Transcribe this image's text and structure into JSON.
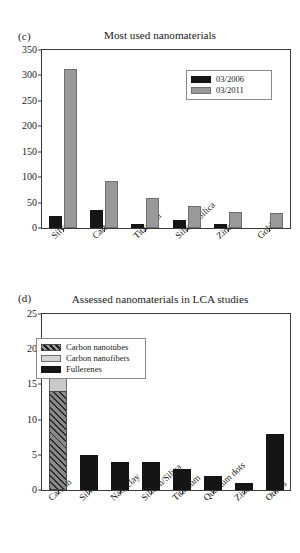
{
  "figure_c": {
    "panel_letter": "(c)",
    "title": "Most used nanomaterials",
    "legend": {
      "entries": [
        {
          "label": "03/2006",
          "swatch": "black"
        },
        {
          "label": "03/2011",
          "swatch": "grey"
        }
      ]
    },
    "chart_data": {
      "type": "bar",
      "title": "Most used nanomaterials",
      "xlabel": "",
      "ylabel": "",
      "ylim": [
        0,
        350
      ],
      "yticks": [
        "0",
        "50",
        "100",
        "150",
        "200",
        "250",
        "300",
        "350"
      ],
      "grid": false,
      "legend_position": "top-right",
      "categories": [
        "Silver",
        "Carbon",
        "Titanium",
        "Silicon/Silica",
        "Zinc",
        "Gold"
      ],
      "series": [
        {
          "name": "03/2006",
          "color": "#151515",
          "values": [
            24,
            35,
            7,
            15,
            8,
            0
          ]
        },
        {
          "name": "03/2011",
          "color": "#999999",
          "values": [
            313,
            92,
            60,
            44,
            32,
            30
          ]
        }
      ]
    }
  },
  "figure_d": {
    "panel_letter": "(d)",
    "title": "Assessed nanomaterials in LCA studies",
    "legend": {
      "entries": [
        {
          "label": "Carbon nanotubes",
          "swatch": "hatch"
        },
        {
          "label": "Carbon nanofibers",
          "swatch": "light"
        },
        {
          "label": "Fullerenes",
          "swatch": "black"
        }
      ]
    },
    "chart_data": {
      "type": "bar",
      "title": "Assessed nanomaterials in LCA studies",
      "xlabel": "",
      "ylabel": "",
      "ylim": [
        0,
        25
      ],
      "yticks": [
        "0",
        "5",
        "10",
        "15",
        "20",
        "25"
      ],
      "grid": false,
      "stacked": true,
      "legend_position": "upper-center-left",
      "categories": [
        "Carbon",
        "Silver",
        "Nanoclay",
        "Silicon/Silica",
        "Titanium",
        "Quantum dots",
        "Zinc",
        "Others"
      ],
      "series": [
        {
          "name": "Carbon nanotubes",
          "color": "hatch",
          "values": [
            14,
            0,
            0,
            0,
            0,
            0,
            0,
            0
          ]
        },
        {
          "name": "Carbon nanofibers",
          "color": "#c9c9c9",
          "values": [
            4,
            0,
            0,
            0,
            0,
            0,
            0,
            0
          ]
        },
        {
          "name": "Fullerenes",
          "color": "#151515",
          "values": [
            3,
            5,
            4,
            4,
            3,
            2,
            1,
            8
          ]
        }
      ],
      "totals": [
        21,
        5,
        4,
        4,
        3,
        2,
        1,
        8
      ]
    }
  }
}
